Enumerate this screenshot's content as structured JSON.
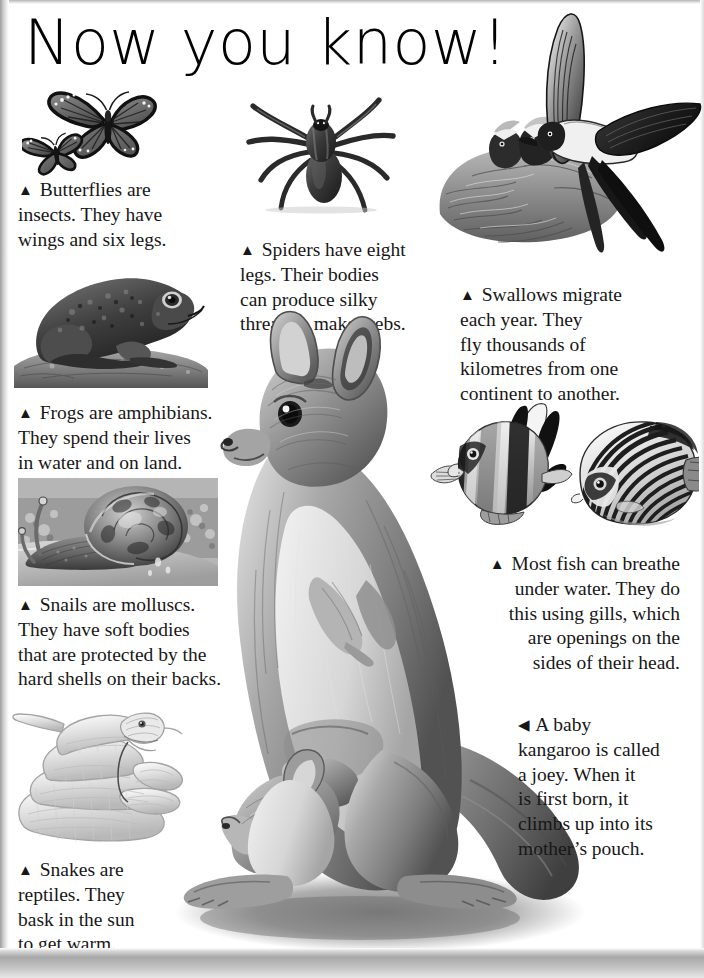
{
  "page": {
    "title": "Now you know!",
    "background_color": "#ffffff",
    "text_color": "#171717",
    "edge_shadow_color": "#a8a8a8"
  },
  "bullets": {
    "up": "▲",
    "left": "◀"
  },
  "entries": [
    {
      "id": "butterflies",
      "figure": "butterflies-illustration",
      "bullet": "▲",
      "lines": [
        "Butterflies are",
        "insects. They have",
        "wings and six legs."
      ],
      "text": "▲ Butterflies are insects. They have wings and six legs.",
      "align": "left"
    },
    {
      "id": "spiders",
      "figure": "spider-illustration",
      "bullet": "▲",
      "lines": [
        "Spiders have eight",
        "legs. Their bodies",
        "can produce silky",
        "thread to make webs."
      ],
      "text": "▲ Spiders have eight legs. Their bodies can produce silky thread to make webs.",
      "align": "left"
    },
    {
      "id": "swallows",
      "figure": "swallow-illustration",
      "bullet": "▲",
      "lines": [
        "Swallows migrate",
        "each year. They",
        "fly thousands of",
        "kilometres from one",
        "continent to another."
      ],
      "text": "▲ Swallows migrate each year. They fly thousands of kilometres from one continent to another.",
      "align": "left"
    },
    {
      "id": "frogs",
      "figure": "frog-illustration",
      "bullet": "▲",
      "lines": [
        "Frogs are amphibians.",
        "They spend their lives",
        "in water and on land."
      ],
      "text": "▲ Frogs are amphibians. They spend their lives in water and on land.",
      "align": "left"
    },
    {
      "id": "snails",
      "figure": "snail-illustration",
      "bullet": "▲",
      "lines": [
        "Snails are molluscs.",
        "They have soft bodies",
        "that are protected by the",
        "hard shells on their backs."
      ],
      "text": "▲ Snails are molluscs. They have soft bodies that are protected by the hard shells on their backs.",
      "align": "left"
    },
    {
      "id": "fish",
      "figure": "fish-illustration",
      "bullet": "▲",
      "lines": [
        "Most fish can breathe",
        "under water. They do",
        "this using gills, which",
        "are openings on the",
        "sides of their head."
      ],
      "text": "▲ Most fish can breathe under water. They do this using gills, which are openings on the sides of their head.",
      "align": "right"
    },
    {
      "id": "snakes",
      "figure": "snake-illustration",
      "bullet": "▲",
      "lines": [
        "Snakes are",
        "reptiles. They",
        "bask in the sun",
        "to get warm."
      ],
      "text": "▲ Snakes are reptiles. They bask in the sun to get warm.",
      "align": "left"
    },
    {
      "id": "kangaroo",
      "figure": "kangaroo-illustration",
      "bullet": "◀",
      "lines": [
        "A baby",
        "kangaroo is called",
        "a joey. When it",
        "is first born, it",
        "climbs up into its",
        "mother’s pouch."
      ],
      "text": "◀ A baby kangaroo is called a joey. When it is first born, it climbs up into its mother’s pouch.",
      "align": "left"
    }
  ],
  "figures": {
    "butterflies": "two monarch butterflies in grayscale",
    "spider": "dark spider with eight legs",
    "swallow": "swallow in flight feeding chicks in a mud nest",
    "frog": "frog sitting on a rock",
    "snail": "snail with spiral shell on a stone",
    "fish": "two striped tropical angelfish",
    "snake": "pale coiled snake",
    "kangaroo": "kangaroo standing with a joey in her pouch"
  }
}
